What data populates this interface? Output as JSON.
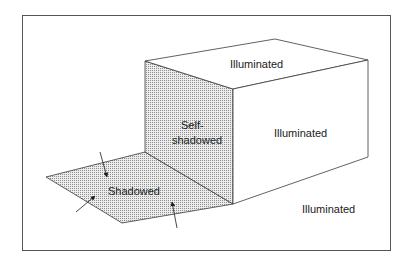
{
  "diagram": {
    "type": "illumination-shadow-illustration",
    "colors": {
      "line": "#3a3a3a",
      "frame": "#555555",
      "shade_dot": "#9a9a9a",
      "shade_bg": "#e6e6e6",
      "background": "#ffffff"
    },
    "labels": {
      "top_face": "Illuminated",
      "right_face": "Illuminated",
      "ground": "Illuminated",
      "front_face_line1": "Self-",
      "front_face_line2": "shadowed",
      "cast_shadow": "Shadowed"
    },
    "regions": [
      {
        "name": "top-face",
        "state": "Illuminated"
      },
      {
        "name": "right-face",
        "state": "Illuminated"
      },
      {
        "name": "front-face",
        "state": "Self-shadowed"
      },
      {
        "name": "cast-shadow",
        "state": "Shadowed"
      },
      {
        "name": "ground-plane",
        "state": "Illuminated"
      }
    ],
    "arrows_count": 3
  }
}
